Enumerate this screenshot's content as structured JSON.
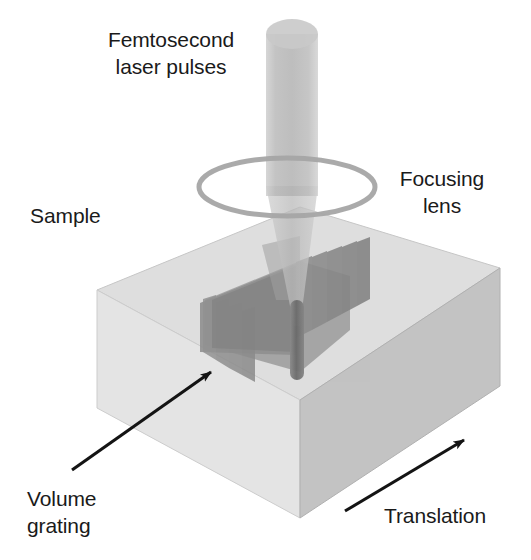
{
  "figure": {
    "background_color": "#ffffff"
  },
  "labels": {
    "laser": {
      "line1": "Femtosecond",
      "line2": "laser pulses"
    },
    "lens": {
      "line1": "Focusing",
      "line2": "lens"
    },
    "sample": {
      "line1": "Sample"
    },
    "grating": {
      "line1": "Volume",
      "line2": "grating"
    },
    "translation": {
      "line1": "Translation"
    }
  },
  "icons": {
    "grating_arrow": "arrow-up-right-icon",
    "translation_arrow": "arrow-up-right-icon",
    "laser_beam": "laser-beam-icon",
    "focusing_lens": "lens-ellipse-icon",
    "sample_block": "cube-icon",
    "volume_grating": "stacked-planes-icon",
    "focal_spot": "focal-rod-icon"
  },
  "colors": {
    "text": "#1a1a1a",
    "cube_top": "#dcdcdc",
    "cube_left": "#e2e2e2",
    "cube_right": "#c2c2c2",
    "cube_edge": "#b8b8b8",
    "beam": "#bdbdbd",
    "beam_cone": "#c8c8c8",
    "lens_ring": "#a8a8a8",
    "grating_plane": "#8f8f8f",
    "grating_plane_dark": "#7d7d7d",
    "focal_rod": "#6e6e6e",
    "arrow": "#141414"
  },
  "geometry": {
    "cube": {
      "top_apex": [
        300,
        207
      ],
      "left_corner": [
        97,
        290
      ],
      "right_corner": [
        500,
        268
      ],
      "front_corner": [
        300,
        400
      ],
      "depth_px": 118
    },
    "lens": {
      "center": [
        287,
        187
      ],
      "rx": 88,
      "ry": 28,
      "stroke_width": 5
    },
    "beam": {
      "top_y": 20,
      "bottom_y": 196,
      "width": 52,
      "center_x": 292
    },
    "cone": {
      "apex": [
        297,
        322
      ],
      "top_half_width": 26
    },
    "focal_rod": {
      "x": 297,
      "top_y": 300,
      "bottom_y": 380,
      "width": 13
    },
    "grating": {
      "plane_count": 9,
      "teeth_count": 7
    }
  }
}
